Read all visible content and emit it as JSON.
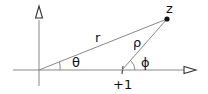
{
  "diagram": {
    "labels": {
      "point": "z",
      "r": "r",
      "rho": "ρ",
      "theta": "θ",
      "phi": "ϕ",
      "tick": "+1"
    },
    "colors": {
      "line": "#888888",
      "point": "#111111",
      "text": "#111111"
    }
  }
}
